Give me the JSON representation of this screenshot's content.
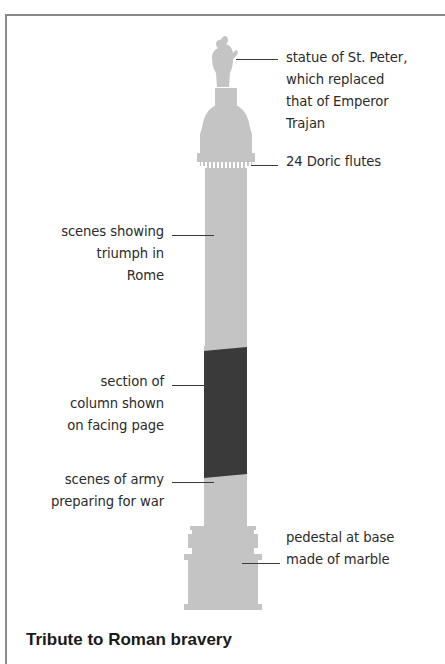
{
  "figure": {
    "title": "Tribute to Roman bravery",
    "subject": "column",
    "colors": {
      "column_fill": "#c4c4c4",
      "highlight_section": "#3a3a3a",
      "flutes": "#ffffff",
      "frame_border": "#8a8a8a",
      "leader_line": "#3a3a3a",
      "text": "#2b2b2b"
    },
    "labels": [
      {
        "id": "statue",
        "side": "right",
        "text": "statue of St. Peter,\nwhich replaced\nthat of Emperor\nTrajan"
      },
      {
        "id": "flutes",
        "side": "right",
        "text": "24 Doric flutes"
      },
      {
        "id": "triumph",
        "side": "left",
        "text": "scenes showing\ntriumph in\nRome"
      },
      {
        "id": "section",
        "side": "left",
        "text": "section of\ncolumn shown\non facing page"
      },
      {
        "id": "army",
        "side": "left",
        "text": "scenes of army\npreparing for war"
      },
      {
        "id": "pedestal",
        "side": "right",
        "text": "pedestal at base\nmade of marble"
      }
    ]
  }
}
